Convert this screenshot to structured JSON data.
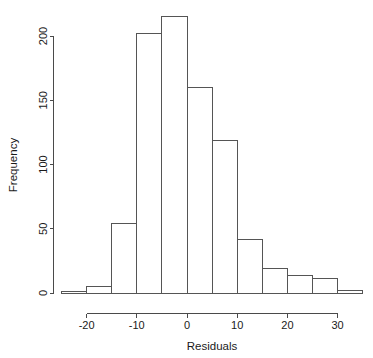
{
  "chart_data": {
    "type": "bar",
    "subtype": "histogram",
    "title": "",
    "xlabel": "Residuals",
    "ylabel": "Frequency",
    "bin_width": 5,
    "bin_edges": [
      -25,
      -20,
      -15,
      -10,
      -5,
      0,
      5,
      10,
      15,
      20,
      25,
      30,
      35
    ],
    "categories": [
      "-25 to -20",
      "-20 to -15",
      "-15 to -10",
      "-10 to -5",
      "-5 to 0",
      "0 to 5",
      "5 to 10",
      "10 to 15",
      "15 to 20",
      "20 to 25",
      "25 to 30",
      "30 to 35"
    ],
    "values": [
      1,
      5,
      54,
      202,
      215,
      160,
      119,
      42,
      19,
      14,
      11,
      2
    ],
    "xlim": [
      -25,
      35
    ],
    "ylim": [
      0,
      215
    ],
    "x_ticks": [
      -20,
      -10,
      0,
      10,
      20,
      30
    ],
    "x_tick_labels": [
      "-20",
      "-10",
      "0",
      "10",
      "20",
      "30"
    ],
    "y_ticks": [
      0,
      50,
      100,
      150,
      200
    ],
    "y_tick_labels": [
      "0",
      "50",
      "100",
      "150",
      "200"
    ],
    "grid": false,
    "legend": "none",
    "bar_fill_color": "#ffffff",
    "bar_border_color": "#555555",
    "axis_color": "#4a4a4a"
  },
  "axes": {
    "x_title": "Residuals",
    "y_title": "Frequency"
  }
}
